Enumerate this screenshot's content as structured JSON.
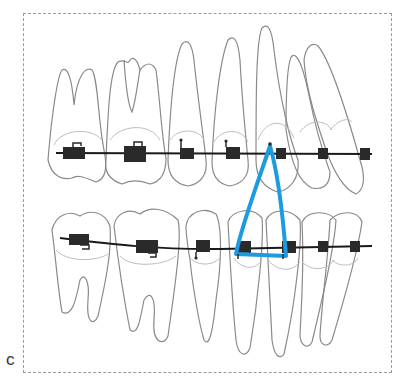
{
  "figure": {
    "panel_label": "c",
    "colors": {
      "tooth_outline": "#8a8a8a",
      "gum_line": "#bdbdbd",
      "archwire": "#1a1a1a",
      "bracket": "#2a2a2a",
      "elastic": "#1e9be0",
      "frame": "#9a9a9a"
    },
    "upper_arch": {
      "bracket_count": 7
    },
    "lower_arch": {
      "bracket_count": 7
    },
    "elastic_shape": "triangle"
  }
}
